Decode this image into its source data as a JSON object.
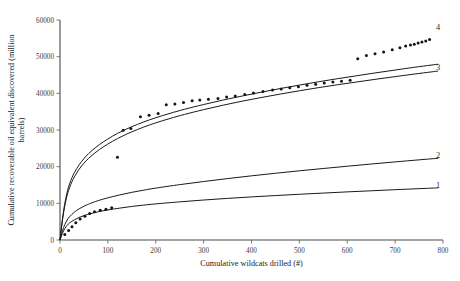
{
  "chart_data": {
    "type": "scatter",
    "title": "",
    "xlabel": "Cumulative wildcats drilled (#)",
    "ylabel": "Cumulative recoverable oil equivalent discovered (million barrels)",
    "xlim": [
      0,
      800
    ],
    "ylim": [
      0,
      60000
    ],
    "xticks": [
      0,
      100,
      200,
      300,
      400,
      500,
      600,
      700,
      800
    ],
    "yticks": [
      0,
      10000,
      20000,
      30000,
      40000,
      50000,
      60000
    ],
    "xtick_labels": [
      "0",
      "100",
      "200",
      "300",
      "400",
      "500",
      "600",
      "700",
      "800"
    ],
    "ytick_labels": [
      "0",
      "10000",
      "20000",
      "30000",
      "40000",
      "50000",
      "60000"
    ],
    "grid": false,
    "legend_position": "inline-right-end-labels",
    "series": [
      {
        "name": "1",
        "label": "1",
        "type": "line",
        "label_x": 790,
        "label_y": 14200,
        "points": [
          [
            0,
            0
          ],
          [
            5,
            1800
          ],
          [
            10,
            3100
          ],
          [
            15,
            4000
          ],
          [
            20,
            4650
          ],
          [
            30,
            5500
          ],
          [
            40,
            6150
          ],
          [
            50,
            6650
          ],
          [
            60,
            7050
          ],
          [
            80,
            7700
          ],
          [
            100,
            8200
          ],
          [
            125,
            8700
          ],
          [
            150,
            9150
          ],
          [
            175,
            9520
          ],
          [
            200,
            9850
          ],
          [
            250,
            10400
          ],
          [
            300,
            10900
          ],
          [
            350,
            11350
          ],
          [
            400,
            11750
          ],
          [
            450,
            12120
          ],
          [
            500,
            12470
          ],
          [
            550,
            12800
          ],
          [
            600,
            13120
          ],
          [
            650,
            13420
          ],
          [
            700,
            13720
          ],
          [
            750,
            14000
          ],
          [
            775,
            14140
          ],
          [
            790,
            14220
          ]
        ]
      },
      {
        "name": "2",
        "label": "2",
        "type": "line",
        "label_x": 790,
        "label_y": 22400,
        "points": [
          [
            0,
            0
          ],
          [
            5,
            2400
          ],
          [
            10,
            4200
          ],
          [
            15,
            5450
          ],
          [
            20,
            6350
          ],
          [
            30,
            7600
          ],
          [
            40,
            8500
          ],
          [
            50,
            9200
          ],
          [
            60,
            9800
          ],
          [
            80,
            10750
          ],
          [
            100,
            11500
          ],
          [
            125,
            12300
          ],
          [
            150,
            13000
          ],
          [
            175,
            13600
          ],
          [
            200,
            14150
          ],
          [
            250,
            15100
          ],
          [
            300,
            15950
          ],
          [
            350,
            16750
          ],
          [
            400,
            17500
          ],
          [
            450,
            18200
          ],
          [
            500,
            18870
          ],
          [
            550,
            19500
          ],
          [
            600,
            20120
          ],
          [
            650,
            20720
          ],
          [
            700,
            21300
          ],
          [
            750,
            21860
          ],
          [
            775,
            22130
          ],
          [
            790,
            22290
          ]
        ]
      },
      {
        "name": "3",
        "label": "3",
        "type": "line",
        "label_x": 790,
        "label_y": 46500,
        "points": [
          [
            0,
            0
          ],
          [
            4,
            4200
          ],
          [
            8,
            7800
          ],
          [
            12,
            10600
          ],
          [
            16,
            12700
          ],
          [
            20,
            14300
          ],
          [
            25,
            15900
          ],
          [
            30,
            17200
          ],
          [
            40,
            19300
          ],
          [
            50,
            20950
          ],
          [
            60,
            22300
          ],
          [
            75,
            23950
          ],
          [
            90,
            25350
          ],
          [
            110,
            26950
          ],
          [
            130,
            28300
          ],
          [
            150,
            29500
          ],
          [
            175,
            30800
          ],
          [
            200,
            31950
          ],
          [
            230,
            33150
          ],
          [
            260,
            34250
          ],
          [
            300,
            35550
          ],
          [
            340,
            36750
          ],
          [
            380,
            37850
          ],
          [
            420,
            38850
          ],
          [
            460,
            39800
          ],
          [
            500,
            40700
          ],
          [
            540,
            41550
          ],
          [
            580,
            42350
          ],
          [
            620,
            43100
          ],
          [
            660,
            43850
          ],
          [
            700,
            44550
          ],
          [
            740,
            45250
          ],
          [
            775,
            45830
          ],
          [
            790,
            46070
          ]
        ]
      },
      {
        "name": "4",
        "label": "4",
        "type": "line",
        "label_x": 790,
        "label_y": 57200,
        "points": [
          [
            0,
            0
          ],
          [
            4,
            4600
          ],
          [
            8,
            8400
          ],
          [
            12,
            11300
          ],
          [
            16,
            13600
          ],
          [
            20,
            15300
          ],
          [
            25,
            17000
          ],
          [
            30,
            18400
          ],
          [
            40,
            20500
          ],
          [
            50,
            22200
          ],
          [
            60,
            23600
          ],
          [
            75,
            25300
          ],
          [
            90,
            26700
          ],
          [
            110,
            28350
          ],
          [
            130,
            29700
          ],
          [
            150,
            30900
          ],
          [
            175,
            32200
          ],
          [
            200,
            33350
          ],
          [
            230,
            34550
          ],
          [
            260,
            35650
          ],
          [
            300,
            36950
          ],
          [
            340,
            38150
          ],
          [
            380,
            39250
          ],
          [
            420,
            40300
          ],
          [
            460,
            41300
          ],
          [
            500,
            42250
          ],
          [
            540,
            43150
          ],
          [
            580,
            44000
          ],
          [
            620,
            44800
          ],
          [
            660,
            45600
          ],
          [
            700,
            46350
          ],
          [
            740,
            47100
          ],
          [
            775,
            47700
          ],
          [
            790,
            47950
          ]
        ]
      },
      {
        "name": "observed",
        "label": "",
        "type": "scatter",
        "points": [
          [
            10,
            1500
          ],
          [
            18,
            2600
          ],
          [
            25,
            3600
          ],
          [
            33,
            4700
          ],
          [
            42,
            5700
          ],
          [
            52,
            6500
          ],
          [
            62,
            7200
          ],
          [
            72,
            7700
          ],
          [
            84,
            8100
          ],
          [
            96,
            8400
          ],
          [
            108,
            8800
          ],
          [
            120,
            22600
          ],
          [
            132,
            29900
          ],
          [
            148,
            30400
          ],
          [
            168,
            33600
          ],
          [
            186,
            34000
          ],
          [
            205,
            34500
          ],
          [
            222,
            36900
          ],
          [
            240,
            37100
          ],
          [
            258,
            37500
          ],
          [
            276,
            38000
          ],
          [
            292,
            38200
          ],
          [
            310,
            38400
          ],
          [
            330,
            38600
          ],
          [
            348,
            39000
          ],
          [
            366,
            39300
          ],
          [
            386,
            39700
          ],
          [
            404,
            40100
          ],
          [
            424,
            40500
          ],
          [
            444,
            40900
          ],
          [
            462,
            41200
          ],
          [
            480,
            41500
          ],
          [
            498,
            41800
          ],
          [
            516,
            42200
          ],
          [
            534,
            42500
          ],
          [
            552,
            42800
          ],
          [
            570,
            43100
          ],
          [
            588,
            43300
          ],
          [
            606,
            43600
          ],
          [
            622,
            49400
          ],
          [
            640,
            50300
          ],
          [
            658,
            50800
          ],
          [
            676,
            51300
          ],
          [
            694,
            51900
          ],
          [
            710,
            52400
          ],
          [
            722,
            52900
          ],
          [
            732,
            53200
          ],
          [
            740,
            53400
          ],
          [
            748,
            53700
          ],
          [
            756,
            54000
          ],
          [
            764,
            54300
          ],
          [
            772,
            54700
          ]
        ]
      }
    ]
  },
  "figure": {
    "background_color": "#ffffff",
    "line_color": "#1a1a1a",
    "axis_color": "#4a4a4a",
    "marker_color": "#141414"
  }
}
